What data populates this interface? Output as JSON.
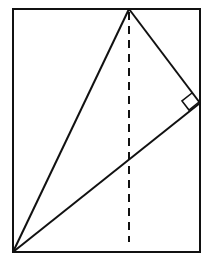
{
  "diagram": {
    "rectangle": {
      "x1": 13,
      "y1": 9,
      "x2": 200,
      "y2": 252
    },
    "triangle": {
      "apex": [
        129,
        9
      ],
      "right_angle_vertex": [
        200,
        103
      ],
      "bottom_left": [
        13,
        252
      ]
    },
    "dashed_line": {
      "x": 129,
      "y1": 12,
      "y2": 242
    },
    "colors": {
      "stroke": "#111111",
      "background": "#ffffff"
    }
  }
}
